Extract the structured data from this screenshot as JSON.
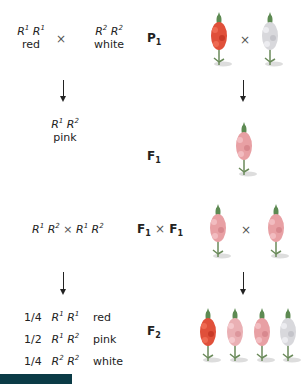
{
  "parents": {
    "left": {
      "allele1": "R",
      "sup1": "1",
      "allele2": "R",
      "sup2": "1",
      "phenotype": "red"
    },
    "cross_symbol": "×",
    "right": {
      "allele1": "R",
      "sup1": "2",
      "allele2": "R",
      "sup2": "2",
      "phenotype": "white"
    },
    "generation": {
      "label": "P",
      "sub": "1"
    },
    "plants": [
      {
        "name": "red-snapdragon",
        "color": "#e0503a"
      },
      {
        "name": "white-snapdragon",
        "color": "#d8d8dc"
      }
    ]
  },
  "f1": {
    "allele1": "R",
    "sup1": "1",
    "allele2": "R",
    "sup2": "2",
    "phenotype": "pink",
    "generation": {
      "label": "F",
      "sub": "1"
    },
    "plant": {
      "name": "pink-snapdragon",
      "color": "#e8a0a4"
    }
  },
  "f1cross": {
    "genotype_left": {
      "a1": "R",
      "s1": "1",
      "a2": "R",
      "s2": "2"
    },
    "times": "×",
    "genotype_right": {
      "a1": "R",
      "s1": "1",
      "a2": "R",
      "s2": "2"
    },
    "generation": {
      "label1": "F",
      "sub1": "1",
      "times": "×",
      "label2": "F",
      "sub2": "1"
    },
    "plants": [
      {
        "name": "pink-snapdragon",
        "color": "#e8a0a4"
      },
      {
        "name": "pink-snapdragon",
        "color": "#e8a0a4"
      }
    ]
  },
  "f2": {
    "rows": [
      {
        "fraction": "1/4",
        "a1": "R",
        "s1": "1",
        "a2": "R",
        "s2": "1",
        "phenotype": "red"
      },
      {
        "fraction": "1/2",
        "a1": "R",
        "s1": "1",
        "a2": "R",
        "s2": "2",
        "phenotype": "pink"
      },
      {
        "fraction": "1/4",
        "a1": "R",
        "s1": "2",
        "a2": "R",
        "s2": "2",
        "phenotype": "white"
      }
    ],
    "generation": {
      "label": "F",
      "sub": "2"
    },
    "plants": [
      {
        "name": "red-snapdragon",
        "color": "#e0503a"
      },
      {
        "name": "pink-snapdragon",
        "color": "#eab0b4"
      },
      {
        "name": "pink-snapdragon",
        "color": "#e8a0a4"
      },
      {
        "name": "white-snapdragon",
        "color": "#d8d8dc"
      }
    ]
  },
  "colors": {
    "accent_bar": "#0b3b46"
  }
}
